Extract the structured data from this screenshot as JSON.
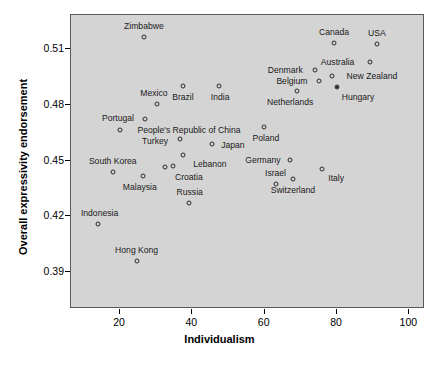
{
  "chart_data": {
    "type": "scatter",
    "title": "",
    "xlabel": "Individualism",
    "ylabel": "Overall expressivity endorsement",
    "xlim": [
      7,
      105
    ],
    "ylim": [
      0.379,
      0.5215
    ],
    "xticks": [
      20,
      40,
      60,
      80,
      100
    ],
    "yticks": [
      0.39,
      0.42,
      0.45,
      0.48,
      0.51
    ],
    "ytick_labels": [
      "0.39",
      "0.42",
      "0.45",
      "0.48",
      "0.51"
    ],
    "xtick_labels": [
      "20",
      "40",
      "60",
      "80",
      "100"
    ],
    "grid": false,
    "legend": null,
    "panel_background": "#d4d4d4",
    "point_color": "#2b2b2b",
    "points": [
      {
        "label": "Zimbabwe",
        "x": 26.6,
        "y": 0.5165,
        "label_dx": 0,
        "label_dy": -11,
        "filled": false
      },
      {
        "label": "Canada",
        "x": 79.2,
        "y": 0.5134,
        "label_dx": 0,
        "label_dy": -11,
        "filled": false
      },
      {
        "label": "USA",
        "x": 91.0,
        "y": 0.5128,
        "label_dx": 0,
        "label_dy": -11,
        "filled": false
      },
      {
        "label": "Australia",
        "x": 89.0,
        "y": 0.5031,
        "label_dx": -32,
        "label_dy": 0,
        "filled": false
      },
      {
        "label": "Denmark",
        "x": 74.0,
        "y": 0.4988,
        "label_dx": -30,
        "label_dy": 0,
        "filled": false
      },
      {
        "label": "New Zealand",
        "x": 78.6,
        "y": 0.4956,
        "label_dx": 40,
        "label_dy": 0,
        "filled": false
      },
      {
        "label": "Belgium",
        "x": 75.0,
        "y": 0.4929,
        "label_dx": -27,
        "label_dy": 0,
        "filled": false
      },
      {
        "label": "Hungary",
        "x": 80.0,
        "y": 0.4896,
        "label_dx": 21,
        "label_dy": 10,
        "filled": true
      },
      {
        "label": "Brazil",
        "x": 37.4,
        "y": 0.4902,
        "label_dx": 0,
        "label_dy": 11,
        "filled": false
      },
      {
        "label": "India",
        "x": 47.4,
        "y": 0.4902,
        "label_dx": 1,
        "label_dy": 11,
        "filled": false
      },
      {
        "label": "Netherlands",
        "x": 69.0,
        "y": 0.4875,
        "label_dx": -7,
        "label_dy": 11,
        "filled": false
      },
      {
        "label": "Mexico",
        "x": 30.2,
        "y": 0.4805,
        "label_dx": -3,
        "label_dy": -11,
        "filled": false
      },
      {
        "label": "Portugal",
        "x": 26.9,
        "y": 0.4724,
        "label_dx": -27,
        "label_dy": -1,
        "filled": false
      },
      {
        "label": "Poland",
        "x": 59.8,
        "y": 0.468,
        "label_dx": 2,
        "label_dy": 11,
        "filled": false
      },
      {
        "label": "People's Republic of China",
        "x": 20.0,
        "y": 0.4665,
        "label_dx": 69,
        "label_dy": 0,
        "filled": false
      },
      {
        "label": "Turkey",
        "x": 36.6,
        "y": 0.4616,
        "label_dx": -25,
        "label_dy": 2,
        "filled": false
      },
      {
        "label": "Japan",
        "x": 45.4,
        "y": 0.4589,
        "label_dx": 21,
        "label_dy": 1,
        "filled": false
      },
      {
        "label": "Lebanon",
        "x": 37.4,
        "y": 0.4529,
        "label_dx": 27,
        "label_dy": 9,
        "filled": false
      },
      {
        "label": "Germany",
        "x": 67.0,
        "y": 0.4502,
        "label_dx": -27,
        "label_dy": 0,
        "filled": false
      },
      {
        "label": "Italy",
        "x": 75.9,
        "y": 0.4453,
        "label_dx": 14,
        "label_dy": 9,
        "filled": false
      },
      {
        "label": "South Korea",
        "x": 18.0,
        "y": 0.4438,
        "label_dx": 0,
        "label_dy": -11,
        "filled": false
      },
      {
        "label": "",
        "x": 34.6,
        "y": 0.447,
        "label_dx": 0,
        "label_dy": 0,
        "filled": false
      },
      {
        "label": "Croatia",
        "x": 32.4,
        "y": 0.4465,
        "label_dx": 24,
        "label_dy": 10,
        "filled": false
      },
      {
        "label": "Malaysia",
        "x": 26.3,
        "y": 0.4416,
        "label_dx": -3,
        "label_dy": 11,
        "filled": false
      },
      {
        "label": "Israel",
        "x": 63.0,
        "y": 0.4373,
        "label_dx": 0,
        "label_dy": -11,
        "filled": false
      },
      {
        "label": "Switzerland",
        "x": 67.8,
        "y": 0.44,
        "label_dx": 0,
        "label_dy": 11,
        "filled": false
      },
      {
        "label": "Russia",
        "x": 39.0,
        "y": 0.4273,
        "label_dx": 1,
        "label_dy": -11,
        "filled": false
      },
      {
        "label": "Indonesia",
        "x": 13.8,
        "y": 0.4158,
        "label_dx": 2,
        "label_dy": -11,
        "filled": false
      },
      {
        "label": "Hong Kong",
        "x": 24.6,
        "y": 0.3959,
        "label_dx": 0,
        "label_dy": -11,
        "filled": false
      }
    ]
  }
}
